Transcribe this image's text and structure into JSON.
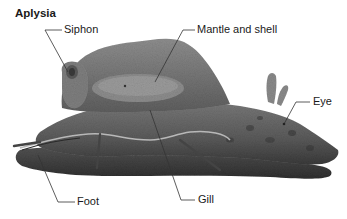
{
  "figure": {
    "title": "Aplysia",
    "labels": {
      "siphon": "Siphon",
      "mantle": "Mantle and shell",
      "eye": "Eye",
      "foot": "Foot",
      "gill": "Gill"
    }
  },
  "colors": {
    "background": "#ffffff",
    "text": "#1a1a1a",
    "leader_line": "#333333",
    "body_dark": "#3a3a3a",
    "body_mid": "#6b6b6b",
    "body_light": "#9a9a9a",
    "mantle": "#8a8a8a"
  }
}
